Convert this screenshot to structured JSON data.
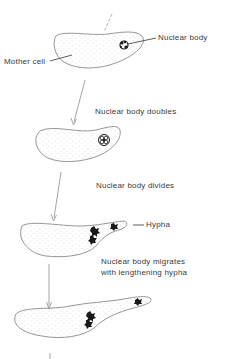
{
  "diagram": {
    "labels": {
      "nuclear_body": "Nuclear body",
      "mother_cell": "Mother cell",
      "doubles": "Nuclear body doubles",
      "divides": "Nuclear body divides",
      "hypha": "Hypha",
      "migrates_line1": "Nuclear body migrates",
      "migrates_line2": "with lengthening hypha"
    },
    "stages": [
      {
        "name": "mother-cell-with-nuclear-body"
      },
      {
        "name": "nuclear-body-doubled"
      },
      {
        "name": "nuclear-body-divided-with-hypha"
      },
      {
        "name": "nuclear-body-migrated-lengthened-hypha"
      }
    ],
    "colors": {
      "outline": "#8a8a8a",
      "stipple": "#b0b0b0",
      "nucleus": "#1a1a1a",
      "arrow": "#9a9a9a",
      "text": "#3a3a3a"
    }
  }
}
